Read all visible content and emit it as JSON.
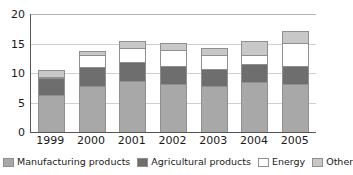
{
  "chart_data": {
    "type": "bar",
    "stacked": true,
    "title": "",
    "subtitle": "",
    "xlabel": "",
    "ylabel": "",
    "categories": [
      "1999",
      "2000",
      "2001",
      "2002",
      "2003",
      "2004",
      "2005"
    ],
    "series": [
      {
        "name": "Manufacturing products",
        "color": "#a8a8a8",
        "values": [
          6.2,
          7.8,
          8.7,
          8.1,
          7.8,
          8.5,
          8.2
        ]
      },
      {
        "name": "Agricultural products",
        "color": "#6e6e6e",
        "values": [
          3.0,
          3.3,
          3.2,
          3.1,
          2.9,
          3.0,
          3.0
        ]
      },
      {
        "name": "Energy",
        "color": "#ffffff",
        "values": [
          0.1,
          1.9,
          2.4,
          2.7,
          2.4,
          1.5,
          3.9
        ]
      },
      {
        "name": "Other",
        "color": "#c8c8c8",
        "values": [
          1.1,
          0.8,
          1.2,
          1.2,
          1.2,
          2.4,
          2.0
        ]
      }
    ],
    "totals": [
      10.4,
      13.8,
      15.5,
      15.1,
      14.3,
      15.4,
      17.1
    ],
    "ylim": [
      0,
      20
    ],
    "yticks": [
      0,
      5,
      10,
      15,
      20
    ],
    "ytick_labels": [
      "0",
      "5",
      "10",
      "15",
      "20"
    ],
    "grid": true,
    "legend_position": "bottom"
  },
  "axis": {
    "y_labels": [
      "20",
      "15",
      "10",
      "5",
      "0"
    ]
  },
  "legend": {
    "items": [
      {
        "label": "Manufacturing products",
        "color": "#a8a8a8"
      },
      {
        "label": "Agricultural products",
        "color": "#6e6e6e"
      },
      {
        "label": "Energy",
        "color": "#ffffff"
      },
      {
        "label": "Other",
        "color": "#c8c8c8"
      }
    ]
  }
}
